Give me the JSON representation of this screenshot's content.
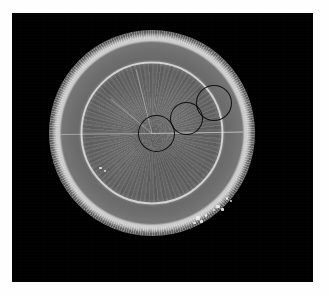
{
  "figure": {
    "kind": "grayscale-specimen-micrograph",
    "colors": {
      "page_background": "#fefefe",
      "plate_background": "#000000",
      "specimen_mid_gray": "#6d6d6d",
      "inner_ring_highlight": "#d8d8d8",
      "outer_rim_dark": "#4a4a4a",
      "roi_outline": "#080808",
      "speckle_highlight": "#ededed"
    },
    "plate": {
      "left": 12,
      "top": 13,
      "width": 301,
      "height": 269
    },
    "disc": {
      "center_x": 152,
      "center_y": 133,
      "radius": 103
    },
    "regions": [
      {
        "name": "outer-scalloped-rim",
        "note": "radially striated dark band at disc margin"
      },
      {
        "name": "bright-boundary-ring",
        "note": "thin high-intensity annulus separating rim from core"
      },
      {
        "name": "textured-core",
        "note": "mottled radial fibre texture filling the disc interior"
      }
    ],
    "annotations": {
      "label": "region-of-interest circles",
      "count": 3,
      "items": [
        {
          "id": "roi-1",
          "order": "1",
          "left": 138,
          "top": 115,
          "size": 37
        },
        {
          "id": "roi-2",
          "order": "2",
          "left": 170,
          "top": 102,
          "size": 33
        },
        {
          "id": "roi-3",
          "order": "3",
          "left": 196,
          "top": 85,
          "size": 36
        }
      ]
    },
    "speckles": [
      {
        "left": 196,
        "top": 216,
        "w": 4,
        "h": 4
      },
      {
        "left": 200,
        "top": 220,
        "w": 3,
        "h": 3
      },
      {
        "left": 193,
        "top": 222,
        "w": 3,
        "h": 2
      },
      {
        "left": 205,
        "top": 214,
        "w": 2,
        "h": 3
      },
      {
        "left": 216,
        "top": 205,
        "w": 4,
        "h": 3
      },
      {
        "left": 221,
        "top": 208,
        "w": 3,
        "h": 3
      },
      {
        "left": 213,
        "top": 209,
        "w": 2,
        "h": 2
      },
      {
        "left": 226,
        "top": 197,
        "w": 2,
        "h": 3
      },
      {
        "left": 230,
        "top": 200,
        "w": 2,
        "h": 2
      },
      {
        "left": 99,
        "top": 167,
        "w": 3,
        "h": 2
      },
      {
        "left": 104,
        "top": 170,
        "w": 2,
        "h": 2
      }
    ]
  }
}
